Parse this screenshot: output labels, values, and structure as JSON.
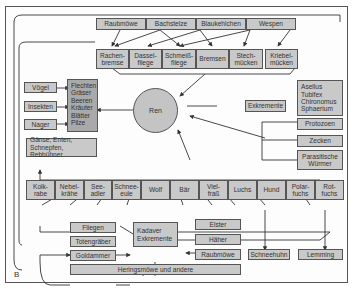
{
  "diagram": {
    "panel_label": "B",
    "center": "Ren",
    "top_predators_row": [
      "Raubmöwe",
      "Bachstelze",
      "Blaukehlchen",
      "Wespen"
    ],
    "parasite_insects_row": [
      "Rachen-\nbremse",
      "Dassel-\nfliege",
      "Schmeiß-\nfliege",
      "Bremsen",
      "Stech-\nmücken",
      "Kriebel-\nmücken"
    ],
    "left_consumers": [
      "Vögel",
      "Insekten",
      "Nager"
    ],
    "food_plants": "Flechten\nGräser\nBeeren\nKräuter\nBlätter\nPilze",
    "birds_group": "Gänse, Enten,\nSchnepfen, Rebhühner",
    "aquatic": "Asellus\nTubifex\nChironomus\nSphaerium",
    "excrement": "Exkremente",
    "parasites_right": [
      "Protozoen",
      "Zecken",
      "Parasitische\nWürmer"
    ],
    "predators_row": [
      "Kolk-\nrabe",
      "Nebel-\nkrähe",
      "See-\nadler",
      "Schnee-\neule",
      "Wolf",
      "Bär",
      "Viel-\nfraß",
      "Luchs",
      "Hund",
      "Polar-\nfuchs",
      "Rot-\nfuchs"
    ],
    "scavengers_left": [
      "Fliegen",
      "Totengräber",
      "Goldammer"
    ],
    "carcass": "Kadaver\nExkremente",
    "scavengers_right": [
      "Elster",
      "Häher",
      "Raubmöwe"
    ],
    "bottom_bar": "Heringsmöwe und andere",
    "prey": [
      "Schneehuhn",
      "Lemming"
    ],
    "colors": {
      "box": "#c9c9c9",
      "dark_box": "#a9a9a9",
      "circle": "#c4c4c4",
      "line": "#333333"
    }
  }
}
